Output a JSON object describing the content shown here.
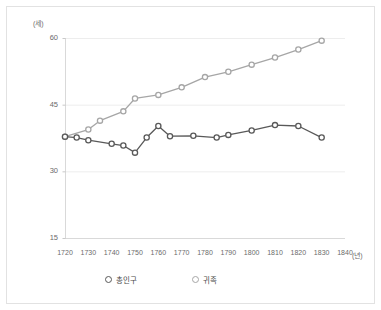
{
  "chart_data": {
    "type": "line",
    "title": "",
    "xlabel": "(년)",
    "ylabel": "(세)",
    "x": [
      1720,
      1730,
      1740,
      1750,
      1760,
      1770,
      1780,
      1790,
      1800,
      1810,
      1820,
      1830
    ],
    "xlim": [
      1715,
      1845
    ],
    "ylim": [
      15,
      63
    ],
    "xticks": [
      1720,
      1730,
      1740,
      1750,
      1760,
      1770,
      1780,
      1790,
      1800,
      1810,
      1820,
      1830,
      1840
    ],
    "xticklabels": [
      "1720",
      "1730",
      "1740",
      "1750",
      "1760",
      "1770",
      "1780",
      "1790",
      "1800",
      "1810",
      "1820",
      "1830",
      "1840"
    ],
    "yticks": [
      15,
      30,
      45,
      60
    ],
    "yticklabels": [
      "15",
      "30",
      "45",
      "60"
    ],
    "grid": true,
    "legend_position": "bottom",
    "series": [
      {
        "name": "총인구",
        "color": "#595959",
        "marker": "open-circle",
        "x": [
          1720,
          1725,
          1730,
          1740,
          1745,
          1750,
          1755,
          1760,
          1765,
          1775,
          1785,
          1790,
          1800,
          1810,
          1820,
          1830
        ],
        "values": [
          37.8,
          37.6,
          37.0,
          36.2,
          35.8,
          34.2,
          37.6,
          40.2,
          37.9,
          38.0,
          37.6,
          38.2,
          39.2,
          40.4,
          40.2,
          37.6
        ]
      },
      {
        "name": "귀족",
        "color": "#a6a6a6",
        "marker": "open-circle",
        "x": [
          1720,
          1730,
          1735,
          1745,
          1750,
          1760,
          1770,
          1780,
          1790,
          1800,
          1810,
          1820,
          1830
        ],
        "values": [
          37.8,
          39.4,
          41.4,
          43.5,
          46.4,
          47.2,
          48.9,
          51.2,
          52.4,
          54.0,
          55.6,
          57.4,
          59.4
        ]
      }
    ]
  },
  "legend": {
    "items": [
      {
        "label": "총인구",
        "color": "#595959"
      },
      {
        "label": "귀족",
        "color": "#a6a6a6"
      }
    ]
  },
  "axes": {
    "y_unit": "(세)",
    "x_unit": "(년)"
  }
}
